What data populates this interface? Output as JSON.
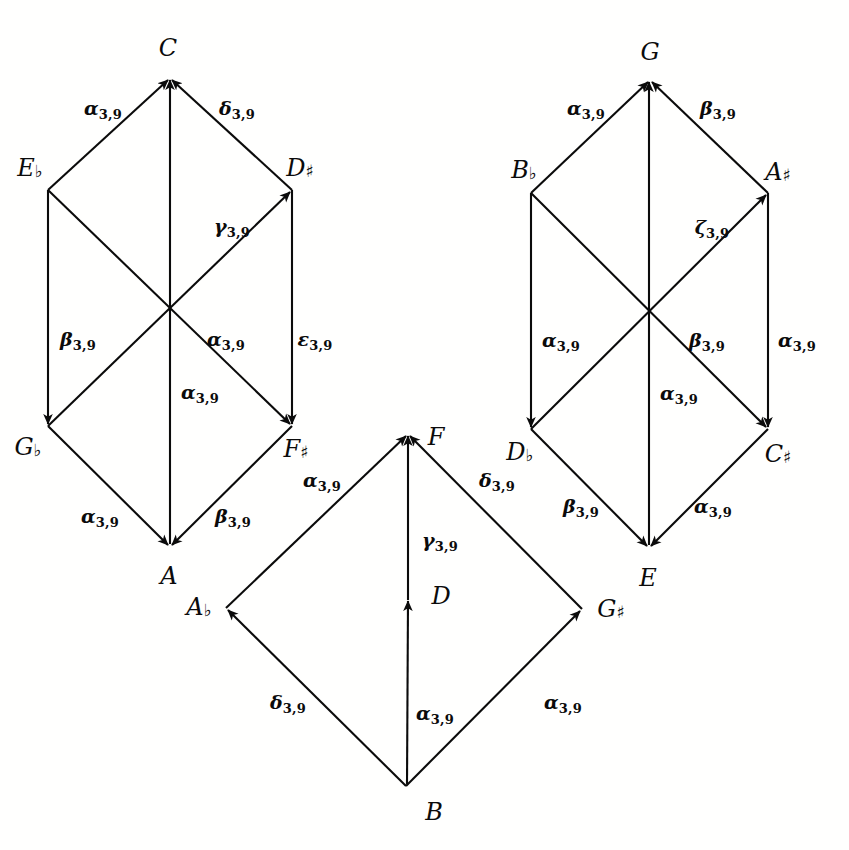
{
  "figure": {
    "kind": "commutative-diagram",
    "background": "#ffffff",
    "ink": "#0b0b0b"
  },
  "nodes": {
    "left_hexagon": {
      "top": {
        "name": "C",
        "accidental": "",
        "x": 168,
        "y": 48
      },
      "upper_left": {
        "name": "E",
        "accidental": "♭",
        "x": 30,
        "y": 168
      },
      "upper_right": {
        "name": "D",
        "accidental": "♯",
        "x": 275,
        "y": 168
      },
      "lower_left": {
        "name": "G",
        "accidental": "♭",
        "x": 28,
        "y": 443
      },
      "lower_right": {
        "name": "F",
        "accidental": "♯",
        "x": 277,
        "y": 443
      },
      "bottom": {
        "name": "A",
        "accidental": "",
        "x": 163,
        "y": 563
      }
    },
    "right_hexagon": {
      "top": {
        "name": "G",
        "accidental": "",
        "x": 641,
        "y": 46
      },
      "upper_left": {
        "name": "B",
        "accidental": "♭",
        "x": 513,
        "y": 155
      },
      "upper_right": {
        "name": "A",
        "accidental": "♯",
        "x": 766,
        "y": 157
      },
      "lower_left": {
        "name": "D",
        "accidental": "♭",
        "x": 512,
        "y": 443
      },
      "lower_right": {
        "name": "C",
        "accidental": "♯",
        "x": 765,
        "y": 445
      },
      "bottom": {
        "name": "E",
        "accidental": "",
        "x": 638,
        "y": 560
      }
    },
    "bottom_diamond": {
      "top": {
        "name": "F",
        "accidental": "",
        "x": 430,
        "y": 428
      },
      "left": {
        "name": "A",
        "accidental": "♭",
        "x": 168,
        "y": 590
      },
      "right": {
        "name": "G",
        "accidental": "♯",
        "x": 590,
        "y": 592
      },
      "bottom": {
        "name": "B",
        "accidental": "",
        "x": 423,
        "y": 800
      },
      "center": {
        "name": "D",
        "accidental": "",
        "x": 430,
        "y": 578
      }
    }
  },
  "edge_labels": {
    "left_hexagon": [
      {
        "id": "Eb-to-C",
        "greek": "α",
        "sub": "3,9",
        "x": 82,
        "y": 95
      },
      {
        "id": "Dsharp-to-C",
        "greek": "δ",
        "sub": "3,9",
        "x": 188,
        "y": 95
      },
      {
        "id": "center-Dsharp",
        "greek": "γ",
        "sub": "3,9",
        "x": 208,
        "y": 212
      },
      {
        "id": "Eb-to-Gb",
        "greek": "β",
        "sub": "3,9",
        "x": 53,
        "y": 328
      },
      {
        "id": "center-Fsharp",
        "greek": "α",
        "sub": "3,9",
        "x": 200,
        "y": 328
      },
      {
        "id": "Dsharp-to-Fsharp",
        "greek": "ε",
        "sub": "3,9",
        "x": 290,
        "y": 328
      },
      {
        "id": "A-to-C-vertical",
        "greek": "α",
        "sub": "3,9",
        "x": 176,
        "y": 382
      },
      {
        "id": "Gb-to-A",
        "greek": "α",
        "sub": "3,9",
        "x": 75,
        "y": 505
      },
      {
        "id": "Fsharp-to-A",
        "greek": "β",
        "sub": "3,9",
        "x": 207,
        "y": 505
      }
    ],
    "right_hexagon": [
      {
        "id": "Bb-to-G",
        "greek": "α",
        "sub": "3,9",
        "x": 565,
        "y": 95
      },
      {
        "id": "Asharp-to-G",
        "greek": "β",
        "sub": "3,9",
        "x": 675,
        "y": 95
      },
      {
        "id": "center-Asharp",
        "greek": "ζ",
        "sub": "3,9",
        "x": 692,
        "y": 213
      },
      {
        "id": "Bb-to-Db",
        "greek": "α",
        "sub": "3,9",
        "x": 536,
        "y": 329
      },
      {
        "id": "center-Csharp",
        "greek": "β",
        "sub": "3,9",
        "x": 682,
        "y": 329
      },
      {
        "id": "Asharp-to-Csharp",
        "greek": "α",
        "sub": "3,9",
        "x": 772,
        "y": 329
      },
      {
        "id": "E-to-G-vertical",
        "greek": "α",
        "sub": "3,9",
        "x": 655,
        "y": 382
      },
      {
        "id": "Db-to-E",
        "greek": "β",
        "sub": "3,9",
        "x": 555,
        "y": 495
      },
      {
        "id": "Csharp-to-E",
        "greek": "α",
        "sub": "3,9",
        "x": 688,
        "y": 495
      }
    ],
    "bottom_diamond": [
      {
        "id": "Ab-to-F",
        "greek": "α",
        "sub": "3,9",
        "x": 296,
        "y": 468
      },
      {
        "id": "Gsharp-to-F",
        "greek": "δ",
        "sub": "3,9",
        "x": 472,
        "y": 468
      },
      {
        "id": "D-to-F",
        "greek": "γ",
        "sub": "3,9",
        "x": 416,
        "y": 528
      },
      {
        "id": "B-to-Ab",
        "greek": "δ",
        "sub": "3,9",
        "x": 263,
        "y": 690
      },
      {
        "id": "B-to-D",
        "greek": "α",
        "sub": "3,9",
        "x": 410,
        "y": 700
      },
      {
        "id": "B-to-Gsharp",
        "greek": "α",
        "sub": "3,9",
        "x": 538,
        "y": 690
      }
    ]
  },
  "edges": {
    "left_hexagon": [
      {
        "id": "Eb-to-C",
        "from": "E♭",
        "to": "C",
        "label": "α3,9"
      },
      {
        "id": "Dsharp-to-C",
        "from": "D♯",
        "to": "C",
        "label": "δ3,9"
      },
      {
        "id": "A-to-C",
        "from": "A",
        "to": "C",
        "label": "α3,9"
      },
      {
        "id": "Gb-to-Dsharp",
        "from": "G♭",
        "to": "D♯",
        "label": "γ3,9"
      },
      {
        "id": "Eb-to-Fsharp",
        "from": "E♭",
        "to": "F♯",
        "label": "α3,9"
      },
      {
        "id": "Eb-to-Gb",
        "from": "E♭",
        "to": "G♭",
        "label": "β3,9"
      },
      {
        "id": "Dsharp-to-Fsharp",
        "from": "D♯",
        "to": "F♯",
        "label": "ε3,9"
      },
      {
        "id": "Gb-to-A",
        "from": "G♭",
        "to": "A",
        "label": "α3,9"
      },
      {
        "id": "Fsharp-to-A",
        "from": "F♯",
        "to": "A",
        "label": "β3,9"
      }
    ],
    "right_hexagon": [
      {
        "id": "Bb-to-G",
        "from": "B♭",
        "to": "G",
        "label": "α3,9"
      },
      {
        "id": "Asharp-to-G",
        "from": "A♯",
        "to": "G",
        "label": "β3,9"
      },
      {
        "id": "E-to-G",
        "from": "E",
        "to": "G",
        "label": "α3,9"
      },
      {
        "id": "Db-to-Asharp",
        "from": "D♭",
        "to": "A♯",
        "label": "ζ3,9"
      },
      {
        "id": "Bb-to-Csharp",
        "from": "B♭",
        "to": "C♯",
        "label": "β3,9"
      },
      {
        "id": "Bb-to-Db",
        "from": "B♭",
        "to": "D♭",
        "label": "α3,9"
      },
      {
        "id": "Asharp-to-Csharp",
        "from": "A♯",
        "to": "C♯",
        "label": "α3,9"
      },
      {
        "id": "Db-to-E",
        "from": "D♭",
        "to": "E",
        "label": "β3,9"
      },
      {
        "id": "Csharp-to-E",
        "from": "C♯",
        "to": "E",
        "label": "α3,9"
      }
    ],
    "bottom_diamond": [
      {
        "id": "Ab-to-F",
        "from": "A♭",
        "to": "F",
        "label": "α3,9"
      },
      {
        "id": "Gsharp-to-F",
        "from": "G♯",
        "to": "F",
        "label": "δ3,9"
      },
      {
        "id": "D-to-F",
        "from": "D",
        "to": "F",
        "label": "γ3,9"
      },
      {
        "id": "B-to-Ab",
        "from": "B",
        "to": "A♭",
        "label": "δ3,9"
      },
      {
        "id": "B-to-D",
        "from": "B",
        "to": "D",
        "label": "α3,9"
      },
      {
        "id": "B-to-Gsharp",
        "from": "B",
        "to": "G♯",
        "label": "α3,9"
      }
    ]
  }
}
